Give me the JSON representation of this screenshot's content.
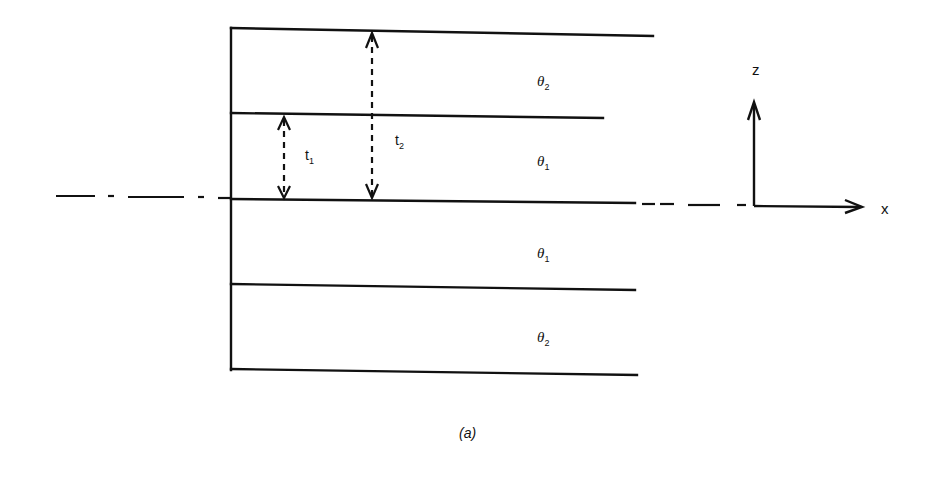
{
  "diagram": {
    "caption": "(a)",
    "layers": [
      {
        "name": "θ",
        "sub": "2",
        "position": "top outer"
      },
      {
        "name": "θ",
        "sub": "1",
        "position": "top inner"
      },
      {
        "name": "θ",
        "sub": "1",
        "position": "bottom inner"
      },
      {
        "name": "θ",
        "sub": "2",
        "position": "bottom outer"
      }
    ],
    "dimensions": [
      {
        "name": "t",
        "sub": "1"
      },
      {
        "name": "t",
        "sub": "2"
      }
    ],
    "axes": {
      "vertical": "z",
      "horizontal": "x"
    },
    "colors": {
      "ink": "#111111",
      "background": "#ffffff"
    }
  }
}
